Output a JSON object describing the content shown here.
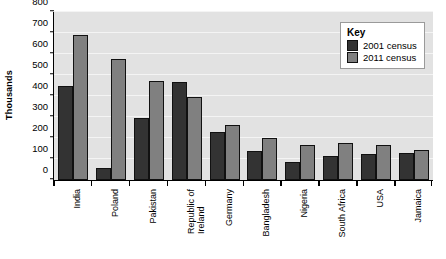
{
  "chart_data": {
    "type": "bar",
    "title": "",
    "xlabel": "",
    "ylabel": "Thousands",
    "ylim": [
      0,
      800
    ],
    "yticks": [
      0,
      100,
      200,
      300,
      400,
      500,
      600,
      700,
      800
    ],
    "grid": true,
    "legend_title": "Key",
    "legend_position": "top-right",
    "categories": [
      "India",
      "Poland",
      "Pakistan",
      "Republic of Ireland",
      "Germany",
      "Bangladesh",
      "Nigeria",
      "South Africa",
      "USA",
      "Jamaica"
    ],
    "category_lines": [
      [
        "India"
      ],
      [
        "Poland"
      ],
      [
        "Pakistan"
      ],
      [
        "Republic of",
        "Ireland"
      ],
      [
        "Germany"
      ],
      [
        "Bangladesh"
      ],
      [
        "Nigeria"
      ],
      [
        "South Africa"
      ],
      [
        "USA"
      ],
      [
        "Jamaica"
      ]
    ],
    "series": [
      {
        "name": "2001 census",
        "color": "#333333",
        "values": [
          450,
          55,
          297,
          465,
          230,
          140,
          88,
          115,
          125,
          128
        ]
      },
      {
        "name": "2011 census",
        "color": "#808080",
        "values": [
          690,
          575,
          470,
          395,
          260,
          198,
          168,
          175,
          165,
          145
        ]
      }
    ]
  },
  "colors": {
    "plot_background": "#e2e2e2",
    "gridline": "#f4f4f4",
    "axis": "#000000",
    "series_2001": "#333333",
    "series_2011": "#808080",
    "legend_background": "#ffffff",
    "legend_border": "#9a9a9a"
  }
}
